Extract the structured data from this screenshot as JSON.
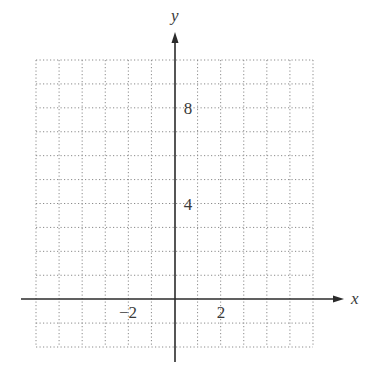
{
  "chart_data": {
    "type": "scatter",
    "title": "",
    "xlabel": "x",
    "ylabel": "y",
    "xlim": [
      -6,
      6
    ],
    "ylim": [
      -2,
      10
    ],
    "grid": true,
    "grid_style": "dotted",
    "grid_step": 1,
    "x_tick_labels": [
      {
        "value": -2,
        "label": "−2"
      },
      {
        "value": 2,
        "label": "2"
      }
    ],
    "y_tick_labels": [
      {
        "value": 4,
        "label": "4"
      },
      {
        "value": 8,
        "label": "8"
      }
    ],
    "series": [],
    "legend": null
  },
  "axes": {
    "x_label": "x",
    "y_label": "y",
    "x_ticks": [
      "−2",
      "2"
    ],
    "y_ticks": [
      "4",
      "8"
    ]
  },
  "colors": {
    "axis": "#2b2b2b",
    "grid": "#8a8a8a",
    "text": "#3a3a3a",
    "background": "#ffffff"
  }
}
